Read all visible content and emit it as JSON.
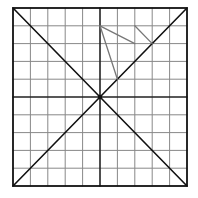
{
  "diagram": {
    "type": "grid-with-diagonals",
    "grid": {
      "cols": 10,
      "rows": 10,
      "left": 13,
      "top": 8,
      "right": 187,
      "bottom": 186
    },
    "colors": {
      "background": "#ffffff",
      "border": "#111111",
      "grid_line": "#888888",
      "center_line": "#222222",
      "diagonal": "#111111",
      "drawn_stroke": "#777777"
    },
    "drawn_strokes": [
      {
        "from": [
          5,
          1
        ],
        "to": [
          7,
          2
        ]
      },
      {
        "from": [
          5,
          1
        ],
        "to": [
          6,
          4
        ]
      },
      {
        "from": [
          7,
          1
        ],
        "to": [
          8,
          2
        ]
      }
    ]
  }
}
